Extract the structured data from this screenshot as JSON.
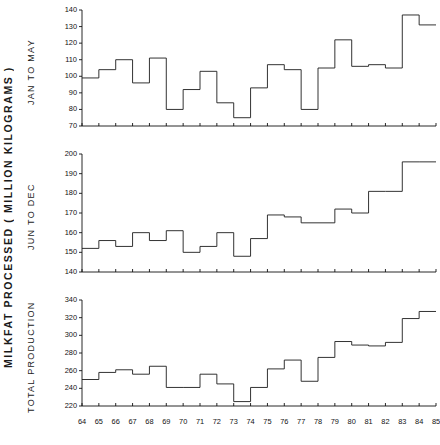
{
  "figure": {
    "axis_title": "MILKFAT PROCESSED ( MILLION KILOGRAMS )",
    "xlabel": "",
    "panel_labels": [
      "JAN TO MAY",
      "JUN TO DEC",
      "TOTAL PRODUCTION"
    ]
  },
  "chart_data": [
    {
      "type": "line",
      "title": "JAN TO MAY",
      "subtitle": "",
      "xlabel": "",
      "ylabel": "JAN TO MAY",
      "drawstyle": "steps-post",
      "grid": false,
      "legend": null,
      "xlim": [
        64,
        85
      ],
      "ylim": [
        70,
        140
      ],
      "xticks": [
        64,
        65,
        66,
        67,
        68,
        69,
        70,
        71,
        72,
        73,
        74,
        75,
        76,
        77,
        78,
        79,
        80,
        81,
        82,
        83,
        84,
        85
      ],
      "yticks": [
        70,
        80,
        90,
        100,
        110,
        120,
        130,
        140
      ],
      "x": [
        64,
        65,
        66,
        67,
        68,
        69,
        70,
        71,
        72,
        73,
        74,
        75,
        76,
        77,
        78,
        79,
        80,
        81,
        82,
        83,
        84,
        85
      ],
      "values": [
        99,
        104,
        110,
        96,
        111,
        80,
        92,
        103,
        84,
        75,
        93,
        107,
        104,
        80,
        105,
        122,
        106,
        107,
        105,
        137,
        131,
        131
      ]
    },
    {
      "type": "line",
      "title": "JUN TO DEC",
      "subtitle": "",
      "xlabel": "",
      "ylabel": "JUN TO DEC",
      "drawstyle": "steps-post",
      "grid": false,
      "legend": null,
      "xlim": [
        64,
        85
      ],
      "ylim": [
        140,
        200
      ],
      "xticks": [
        64,
        65,
        66,
        67,
        68,
        69,
        70,
        71,
        72,
        73,
        74,
        75,
        76,
        77,
        78,
        79,
        80,
        81,
        82,
        83,
        84,
        85
      ],
      "yticks": [
        140,
        150,
        160,
        170,
        180,
        190,
        200
      ],
      "x": [
        64,
        65,
        66,
        67,
        68,
        69,
        70,
        71,
        72,
        73,
        74,
        75,
        76,
        77,
        78,
        79,
        80,
        81,
        82,
        83,
        84,
        85
      ],
      "values": [
        152,
        156,
        153,
        160,
        156,
        161,
        150,
        153,
        160,
        148,
        157,
        169,
        168,
        165,
        165,
        172,
        170,
        181,
        181,
        196,
        196,
        196
      ]
    },
    {
      "type": "line",
      "title": "TOTAL PRODUCTION",
      "subtitle": "",
      "xlabel": "",
      "ylabel": "TOTAL PRODUCTION",
      "drawstyle": "steps-post",
      "grid": false,
      "legend": null,
      "xlim": [
        64,
        85
      ],
      "ylim": [
        220,
        340
      ],
      "xticks": [
        64,
        65,
        66,
        67,
        68,
        69,
        70,
        71,
        72,
        73,
        74,
        75,
        76,
        77,
        78,
        79,
        80,
        81,
        82,
        83,
        84,
        85
      ],
      "yticks": [
        220,
        240,
        260,
        280,
        300,
        320,
        340
      ],
      "x": [
        64,
        65,
        66,
        67,
        68,
        69,
        70,
        71,
        72,
        73,
        74,
        75,
        76,
        77,
        78,
        79,
        80,
        81,
        82,
        83,
        84,
        85
      ],
      "values": [
        250,
        258,
        261,
        256,
        265,
        241,
        241,
        256,
        245,
        225,
        241,
        262,
        272,
        248,
        275,
        293,
        289,
        288,
        292,
        319,
        327,
        327
      ]
    }
  ]
}
